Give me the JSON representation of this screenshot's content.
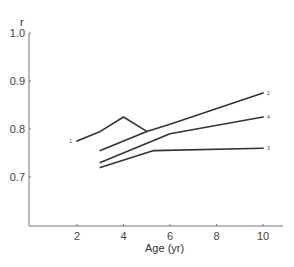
{
  "chart_data": {
    "type": "line",
    "title": "",
    "xlabel": "Age (yr)",
    "ylabel": "r",
    "xlim": [
      0.4,
      10.8
    ],
    "ylim": [
      0.6,
      1.0
    ],
    "x_ticks": [
      2,
      4,
      6,
      8,
      10
    ],
    "x_tick_labels": [
      "2",
      "4",
      "6",
      "8",
      "10"
    ],
    "y_ticks": [
      0.7,
      0.8,
      0.9,
      1.0
    ],
    "y_tick_labels": [
      "0.7",
      "0.8",
      "0.9",
      "1.0"
    ],
    "grid": false,
    "legend": "inline labels at line ends",
    "series": [
      {
        "name": "1",
        "x": [
          2,
          3,
          4,
          5
        ],
        "values": [
          0.775,
          0.795,
          0.825,
          0.795
        ]
      },
      {
        "name": "2",
        "x": [
          3,
          5,
          6,
          10
        ],
        "values": [
          0.755,
          0.795,
          0.81,
          0.875
        ]
      },
      {
        "name": "4",
        "x": [
          3,
          6,
          10
        ],
        "values": [
          0.73,
          0.79,
          0.825
        ]
      },
      {
        "name": "3",
        "x": [
          3,
          5.3,
          10
        ],
        "values": [
          0.72,
          0.755,
          0.76
        ]
      }
    ]
  }
}
